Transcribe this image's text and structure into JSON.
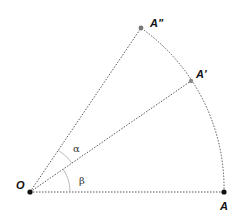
{
  "diagram": {
    "type": "rotation-sector",
    "points": {
      "O": {
        "label": "O",
        "x": 30,
        "y": 192
      },
      "A": {
        "label": "A",
        "x": 224,
        "y": 192
      },
      "A1": {
        "label": "A'",
        "x": 191,
        "y": 81
      },
      "A2": {
        "label": "A\"",
        "x": 141,
        "y": 28
      }
    },
    "angles": {
      "alpha": {
        "label": "α",
        "between": [
          "OA1",
          "OA2"
        ]
      },
      "beta": {
        "label": "β",
        "between": [
          "OA",
          "OA1"
        ]
      }
    },
    "colors": {
      "line": "#555555",
      "point_dark": "#111111",
      "point_gray": "#777777",
      "arc": "#999999"
    }
  }
}
